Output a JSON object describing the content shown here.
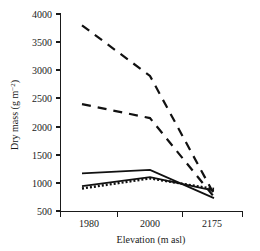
{
  "chart_data": {
    "type": "line",
    "title": "",
    "xlabel": "Elevation (m asl)",
    "ylabel": "Dry mass (g m−2)",
    "ylabel_main": "Dry mass (g m",
    "ylabel_sup": "−2",
    "ylabel_close": ")",
    "categories": [
      "1980",
      "2000",
      "2175"
    ],
    "x_tick_labels": [
      "1980",
      "2000",
      "2175"
    ],
    "y_tick_labels": [
      "4000",
      "3500",
      "3000",
      "2500",
      "2000",
      "1500",
      "1000",
      "500"
    ],
    "y_tick_values": [
      4000,
      3500,
      3000,
      2500,
      2000,
      1500,
      1000,
      500
    ],
    "ylim": [
      500,
      4000
    ],
    "grid": false,
    "legend": "none",
    "series": [
      {
        "name": "series-1-long-dashed-upper",
        "style": "long-dashed",
        "dash": "9 7",
        "width": 2.2,
        "color": "#111111",
        "values": [
          3800,
          2900,
          800
        ]
      },
      {
        "name": "series-2-long-dashed-lower",
        "style": "long-dashed",
        "dash": "9 7",
        "width": 2.2,
        "color": "#111111",
        "values": [
          2400,
          2150,
          750
        ]
      },
      {
        "name": "series-3-solid-upper",
        "style": "solid",
        "dash": "none",
        "width": 1.8,
        "color": "#111111",
        "values": [
          1170,
          1230,
          730
        ]
      },
      {
        "name": "series-4-solid-lower",
        "style": "solid",
        "dash": "none",
        "width": 1.8,
        "color": "#111111",
        "values": [
          940,
          1100,
          860
        ]
      },
      {
        "name": "series-5-dotted",
        "style": "dotted",
        "dash": "2 2",
        "width": 2.4,
        "color": "#111111",
        "values": [
          900,
          1080,
          890
        ]
      }
    ]
  },
  "colors": {
    "ink": "#111111",
    "background": "#ffffff"
  }
}
